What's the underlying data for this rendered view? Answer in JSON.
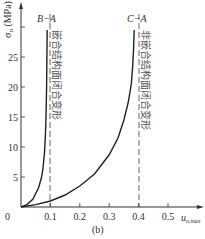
{
  "chart_data": {
    "type": "line",
    "title": "",
    "caption": "(b)",
    "xlabel": "u_n,max",
    "xlabel_main": "u",
    "xlabel_sub": "n,max",
    "ylabel": "σn (MPa)",
    "ylabel_main": "σ",
    "ylabel_sub": "n",
    "ylabel_unit": " (MPa)",
    "xlim": [
      0,
      0.55
    ],
    "ylim": [
      0,
      30
    ],
    "x_ticks": [
      0,
      0.1,
      0.2,
      0.3,
      0.4,
      0.5
    ],
    "x_tick_labels": [
      "0",
      "0.1",
      "0.2",
      "0.3",
      "0.4",
      "0.5"
    ],
    "y_ticks": [
      5,
      10,
      15,
      20,
      25,
      30
    ],
    "y_tick_labels": [
      "5",
      "10",
      "15",
      "20",
      "25",
      ""
    ],
    "grid": false,
    "legend": "none",
    "series": [
      {
        "name": "B-A",
        "description": "嵌合结构面闭合变形",
        "x": [
          0,
          0.02,
          0.04,
          0.06,
          0.07,
          0.075,
          0.08,
          0.083,
          0.085,
          0.087,
          0.088,
          0.089
        ],
        "values": [
          0,
          0.4,
          1.3,
          3.2,
          5.0,
          6.5,
          9.0,
          12.0,
          15.0,
          20.0,
          25.0,
          29.5
        ],
        "asymptote_x": 0.1
      },
      {
        "name": "C-A",
        "description": "非嵌合结构面闭合变形",
        "x": [
          0,
          0.05,
          0.1,
          0.15,
          0.2,
          0.25,
          0.3,
          0.33,
          0.35,
          0.365,
          0.375,
          0.38,
          0.383,
          0.385
        ],
        "values": [
          0,
          0.4,
          1.0,
          2.0,
          3.5,
          5.5,
          8.7,
          11.5,
          14.5,
          17.5,
          20.5,
          23.5,
          26.5,
          29.5
        ],
        "asymptote_x": 0.4
      }
    ],
    "annotations": [
      {
        "text": "嵌合结构面闭合变形",
        "x": 0.1,
        "orientation": "vertical",
        "line": "dashed"
      },
      {
        "text": "非嵌合结构面闭合变形",
        "x": 0.4,
        "orientation": "vertical",
        "line": "dashed"
      }
    ]
  },
  "labels": {
    "series_b": "B−A",
    "series_c": "C−A",
    "anno_b": "嵌合结构面闭合变形",
    "anno_c": "非嵌合结构面闭合变形",
    "origin": "0"
  }
}
